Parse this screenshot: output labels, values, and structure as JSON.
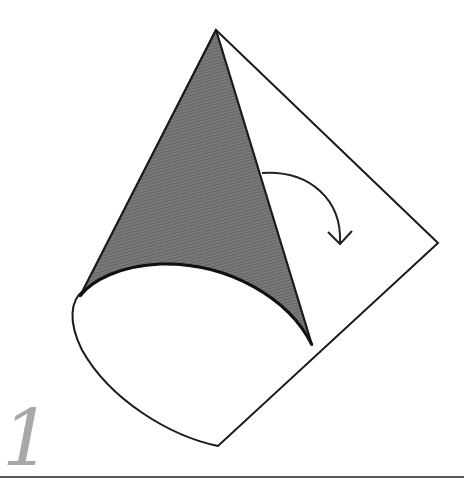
{
  "step": {
    "number": "1"
  },
  "diagram": {
    "colors": {
      "stroke": "#1a1a1a",
      "cone_fill": "#6e6e6e",
      "paper": "#ffffff",
      "step_number": "#a8a8a8",
      "rule": "#5a5a5a"
    },
    "elements": [
      "cone-shaded-side",
      "paper-sheet-outline",
      "curved-arrow-fold-direction"
    ]
  }
}
